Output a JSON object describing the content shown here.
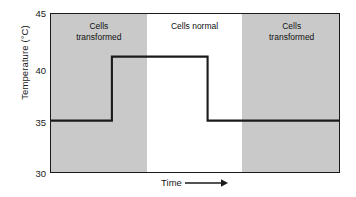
{
  "chart_data": {
    "type": "line",
    "title": "",
    "xlabel": "Time",
    "ylabel": "Temperature (°C)",
    "ylim": [
      30,
      45
    ],
    "yticks": [
      45,
      40,
      35,
      30
    ],
    "ytick_labels": [
      "45",
      "40",
      "35",
      "30"
    ],
    "xlim": [
      0,
      100
    ],
    "xticks": [],
    "grid": false,
    "legend": false,
    "axis_arrow": "right-arrow",
    "series": [
      {
        "name": "Temperature",
        "step": "post",
        "color": "#1a1a1a",
        "x": [
          0,
          21,
          21,
          54,
          54,
          100
        ],
        "y": [
          35,
          35,
          41,
          41,
          35,
          35
        ],
        "points": [
          {
            "x": 0,
            "y": 35
          },
          {
            "x": 21,
            "y": 35
          },
          {
            "x": 21,
            "y": 41
          },
          {
            "x": 54,
            "y": 41
          },
          {
            "x": 54,
            "y": 35
          },
          {
            "x": 100,
            "y": 35
          }
        ]
      }
    ],
    "bands": [
      {
        "id": "left",
        "label": "Cells\ntransformed",
        "line1": "Cells",
        "line2": "transformed",
        "x_start": 0,
        "x_end": 33,
        "shaded": true,
        "color": "#c9c9c9"
      },
      {
        "id": "middle",
        "label": "Cells normal",
        "line1": "Cells normal",
        "line2": "",
        "x_start": 33,
        "x_end": 66,
        "shaded": false,
        "color": "#ffffff"
      },
      {
        "id": "right",
        "label": "Cells\ntransformed",
        "line1": "Cells",
        "line2": "transformed",
        "x_start": 66,
        "x_end": 100,
        "shaded": true,
        "color": "#c9c9c9"
      }
    ],
    "annotations": [
      "Permissive temperature 35 °C → cells transformed",
      "Restrictive temperature 41 °C → cells normal"
    ]
  },
  "axes": {
    "y_title": "Temperature (°C)",
    "y_labels": {
      "t45": "45",
      "t40": "40",
      "t35": "35",
      "t30": "30"
    },
    "x_title": "Time"
  },
  "bands": {
    "left": {
      "line1": "Cells",
      "line2": "transformed"
    },
    "middle": {
      "line1": "Cells normal",
      "line2": ""
    },
    "right": {
      "line1": "Cells",
      "line2": "transformed"
    }
  },
  "colors": {
    "shaded_band": "#c9c9c9",
    "plot_background": "#ffffff",
    "trace": "#1a1a1a",
    "frame": "#1a1a1a",
    "text": "#1a1a1a"
  }
}
